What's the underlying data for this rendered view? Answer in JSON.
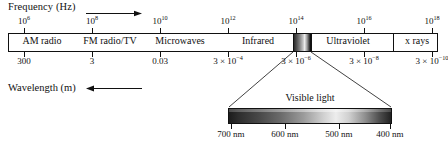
{
  "figure": {
    "type": "electromagnetic-spectrum-diagram",
    "frequency_axis": {
      "label": "Frequency (Hz)",
      "arrow_direction": "right",
      "unit": "Hz",
      "ticks": [
        {
          "mantissa": "10",
          "exponent": "6",
          "x": 24
        },
        {
          "mantissa": "10",
          "exponent": "8",
          "x": 92
        },
        {
          "mantissa": "10",
          "exponent": "10",
          "x": 160
        },
        {
          "mantissa": "10",
          "exponent": "12",
          "x": 228
        },
        {
          "mantissa": "10",
          "exponent": "14",
          "x": 296
        },
        {
          "mantissa": "10",
          "exponent": "16",
          "x": 364
        },
        {
          "mantissa": "10",
          "exponent": "18",
          "x": 432
        }
      ]
    },
    "wavelength_axis": {
      "label": "Wavelength (m)",
      "arrow_direction": "left",
      "unit": "m",
      "ticks": [
        {
          "text": "300",
          "mantissa": "",
          "exponent": "",
          "x": 24
        },
        {
          "text": "3",
          "mantissa": "",
          "exponent": "",
          "x": 92
        },
        {
          "text": "0.03",
          "mantissa": "",
          "exponent": "",
          "x": 160
        },
        {
          "text": "",
          "mantissa": "3 × 10",
          "exponent": "−4",
          "x": 228
        },
        {
          "text": "",
          "mantissa": "3 × 10",
          "exponent": "−6",
          "x": 296
        },
        {
          "text": "",
          "mantissa": "3 × 10",
          "exponent": "−8",
          "x": 364
        },
        {
          "text": "",
          "mantissa": "3 × 10",
          "exponent": "−10",
          "x": 432
        }
      ]
    },
    "bands": [
      {
        "name": "AM radio",
        "x": 42
      },
      {
        "name": "FM radio/TV",
        "x": 110
      },
      {
        "name": "Microwaves",
        "x": 180
      },
      {
        "name": "Infrared",
        "x": 258
      },
      {
        "name": "Ultraviolet",
        "x": 348
      },
      {
        "name": "x rays",
        "x": 417
      }
    ],
    "band_dividers_x": [
      311,
      393
    ],
    "visible_slice": {
      "x_start": 293,
      "x_end": 311
    },
    "visible_detail": {
      "caption": "Visible light",
      "bar": {
        "x_start": 228,
        "x_end": 392
      },
      "ticks": [
        {
          "label": "700 nm",
          "x": 231
        },
        {
          "label": "600 nm",
          "x": 285
        },
        {
          "label": "500 nm",
          "x": 339
        },
        {
          "label": "400 nm",
          "x": 390
        }
      ]
    },
    "colors": {
      "stroke": "#111111",
      "background": "#ffffff",
      "gradient_dark": "#1c1c1c",
      "gradient_light": "#ededed"
    }
  }
}
